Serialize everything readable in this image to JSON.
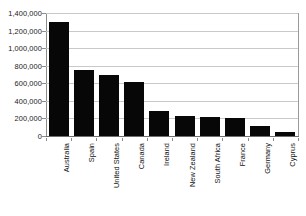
{
  "chart_data": {
    "type": "bar",
    "title": "",
    "subtitle": "",
    "xlabel": "",
    "ylabel": "",
    "categories": [
      "Australia",
      "Spain",
      "United States",
      "Canada",
      "Ireland",
      "New Zealand",
      "South Africa",
      "France",
      "Germany",
      "Cyprus"
    ],
    "values": [
      1300000,
      750000,
      690000,
      620000,
      280000,
      225000,
      220000,
      210000,
      110000,
      50000
    ],
    "ylim": [
      0,
      1400000
    ],
    "ytick_values": [
      0,
      200000,
      400000,
      600000,
      800000,
      1000000,
      1200000,
      1400000
    ],
    "ytick_labels": [
      "0",
      "200,000",
      "400,000",
      "600,000",
      "800,000",
      "1,000,000",
      "1,200,000",
      "1,400,000"
    ],
    "grid": true,
    "grid_axis": "y",
    "legend": false,
    "legend_position": "none",
    "bar_color": "#070707",
    "gridline_color": "#c9c9c9",
    "axis_color": "#8c8c8c",
    "background_color": "#ffffff",
    "xtick_label_rotation": -90
  }
}
